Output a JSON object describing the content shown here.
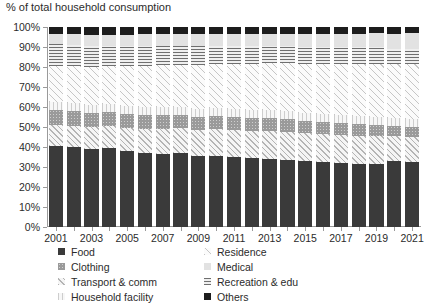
{
  "chart_data": {
    "type": "bar",
    "stacked": true,
    "stack_mode": "percent",
    "title": "% of total household consumption",
    "xlabel": "",
    "ylabel": "% of total household consumption",
    "ylim": [
      0,
      100
    ],
    "ytick_labels": [
      "0%",
      "10%",
      "20%",
      "30%",
      "40%",
      "50%",
      "60%",
      "70%",
      "80%",
      "90%",
      "100%"
    ],
    "ytick_values": [
      0,
      10,
      20,
      30,
      40,
      50,
      60,
      70,
      80,
      90,
      100
    ],
    "grid": false,
    "legend_position": "bottom",
    "categories": [
      "2001",
      "2002",
      "2003",
      "2004",
      "2005",
      "2006",
      "2007",
      "2008",
      "2009",
      "2010",
      "2011",
      "2012",
      "2013",
      "2014",
      "2015",
      "2016",
      "2017",
      "2018",
      "2019",
      "2020",
      "2021"
    ],
    "xtick_labels": [
      "2001",
      "2003",
      "2005",
      "2007",
      "2009",
      "2011",
      "2013",
      "2015",
      "2017",
      "2019",
      "2021"
    ],
    "series": [
      {
        "name": "Food",
        "pattern": "dark-dotted",
        "values": [
          40.5,
          40.0,
          39.0,
          39.5,
          38.0,
          37.0,
          36.5,
          37.0,
          35.5,
          35.5,
          35.0,
          34.5,
          34.0,
          33.5,
          33.0,
          32.5,
          32.0,
          31.5,
          31.5,
          33.0,
          32.5
        ]
      },
      {
        "name": "Transport & comm",
        "pattern": "light-diagonal",
        "values": [
          10.5,
          10.5,
          11.0,
          11.0,
          11.5,
          12.0,
          12.5,
          12.5,
          13.0,
          13.5,
          13.5,
          13.5,
          14.0,
          14.0,
          14.0,
          14.0,
          14.0,
          14.0,
          14.0,
          12.5,
          12.5
        ]
      },
      {
        "name": "Clothing",
        "pattern": "medium-gray-dotted",
        "values": [
          7.5,
          7.5,
          7.0,
          7.0,
          7.0,
          7.0,
          7.0,
          6.5,
          6.5,
          6.5,
          6.5,
          6.5,
          6.5,
          6.5,
          6.0,
          6.0,
          6.0,
          6.0,
          5.5,
          5.0,
          5.0
        ]
      },
      {
        "name": "Household facility",
        "pattern": "light-vertical",
        "values": [
          4.0,
          4.0,
          4.0,
          4.0,
          4.0,
          4.0,
          4.0,
          4.0,
          4.0,
          4.0,
          4.0,
          4.0,
          4.0,
          4.0,
          4.0,
          4.0,
          4.0,
          4.0,
          4.0,
          4.0,
          4.0
        ]
      },
      {
        "name": "Residence",
        "pattern": "diagonal-hatch",
        "values": [
          18.0,
          18.5,
          19.0,
          19.0,
          20.0,
          20.5,
          21.0,
          21.0,
          22.0,
          22.0,
          22.5,
          23.0,
          23.5,
          24.0,
          24.5,
          25.0,
          25.5,
          26.0,
          26.5,
          27.0,
          27.5
        ]
      },
      {
        "name": "Recreation & edu",
        "pattern": "horizontal-lines",
        "values": [
          11.0,
          10.5,
          10.5,
          10.0,
          10.0,
          10.0,
          9.5,
          9.5,
          9.5,
          9.0,
          9.0,
          9.0,
          8.5,
          8.5,
          8.5,
          8.5,
          8.5,
          8.5,
          8.5,
          7.5,
          7.5
        ]
      },
      {
        "name": "Medical",
        "pattern": "light-dotted",
        "values": [
          5.0,
          5.5,
          5.5,
          5.5,
          5.5,
          6.0,
          6.0,
          6.0,
          6.0,
          6.0,
          6.0,
          6.0,
          6.0,
          6.0,
          6.5,
          6.5,
          6.5,
          6.5,
          7.0,
          7.5,
          8.0
        ]
      },
      {
        "name": "Others",
        "pattern": "solid-black",
        "values": [
          3.5,
          3.5,
          4.0,
          4.0,
          4.0,
          3.5,
          3.5,
          3.5,
          3.5,
          3.5,
          3.5,
          3.5,
          3.5,
          3.5,
          3.5,
          3.5,
          3.5,
          3.5,
          3.0,
          3.5,
          3.0
        ]
      }
    ],
    "legend": [
      {
        "label": "Food",
        "pattern": "dark-dotted"
      },
      {
        "label": "Residence",
        "pattern": "diagonal-hatch"
      },
      {
        "label": "Clothing",
        "pattern": "medium-gray-dotted"
      },
      {
        "label": "Medical",
        "pattern": "light-dotted"
      },
      {
        "label": "Transport & comm",
        "pattern": "light-diagonal"
      },
      {
        "label": "Recreation & edu",
        "pattern": "horizontal-lines"
      },
      {
        "label": "Household facility",
        "pattern": "light-vertical"
      },
      {
        "label": "Others",
        "pattern": "solid-black"
      }
    ]
  }
}
